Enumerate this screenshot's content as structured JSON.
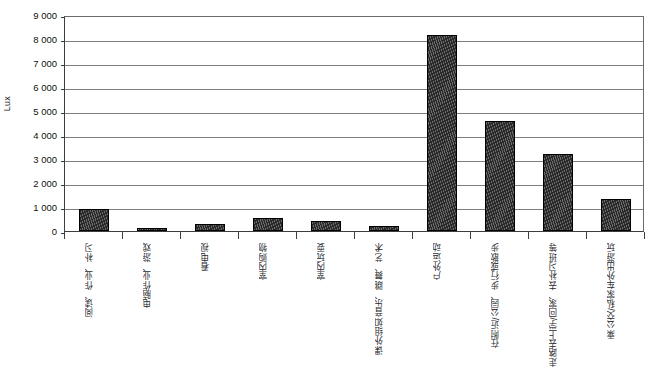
{
  "chart_data": {
    "type": "bar",
    "title": "",
    "subtitle": "",
    "xlabel": "",
    "ylabel": "Lux",
    "ylim": [
      0,
      9000
    ],
    "ytick_step": 1000,
    "grid": true,
    "legend": null,
    "legend_position": "none",
    "bar_color": "#2a2a2a",
    "bar_edge_color": "#000000",
    "gridline_color": "#7d7d7d",
    "axis_color": "#3d3d3d",
    "categories": [
      "阅读、作业、补习",
      "电脑作业、游戏",
      "看电视",
      "室内购物",
      "室内玩耍",
      "课外组如音乐、跳舞、艺术",
      "户外运动",
      "在附近/公园、步行或散步",
      "走路去上学/回家、去补习班等",
      "乘公交/私家车外出游玩"
    ],
    "values": [
      900,
      100,
      300,
      550,
      400,
      200,
      8150,
      4600,
      3200,
      1350
    ],
    "ytick_labels": [
      "9 000",
      "8 000",
      "7 000",
      "6 000",
      "5 000",
      "4 000",
      "3 000",
      "2 000",
      "1 000",
      "0"
    ],
    "ytick_values": [
      9000,
      8000,
      7000,
      6000,
      5000,
      4000,
      3000,
      2000,
      1000,
      0
    ]
  }
}
